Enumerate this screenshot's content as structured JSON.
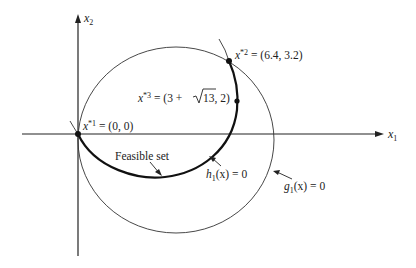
{
  "axes": {
    "x_label": "x",
    "x_sub": "1",
    "y_label": "x",
    "y_sub": "2"
  },
  "points": {
    "p1": {
      "name": "x",
      "sup": "*1",
      "value": " = (0, 0)"
    },
    "p2": {
      "name": "x",
      "sup": "*2",
      "value": " = (6.4, 3.2)"
    },
    "p3": {
      "name": "x",
      "sup": "*3",
      "pre": " = (3 + ",
      "sqrt": "13",
      "post": ", 2)"
    }
  },
  "labels": {
    "feasible": "Feasible set",
    "h_name": "h",
    "h_sub": "1",
    "h_rest": "(x) = 0",
    "g_name": "g",
    "g_sub": "1",
    "g_rest": "(x) = 0"
  },
  "colors": {
    "ink": "#222222",
    "background": "#ffffff"
  }
}
